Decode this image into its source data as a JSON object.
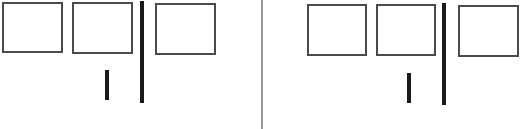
{
  "figure": {
    "width": 525,
    "height": 129,
    "background": "#ffffff",
    "colors": {
      "box_border": "#4a4a4a",
      "bar": "#1a1a1a",
      "divider": "#9a9a9a"
    }
  },
  "panels": [
    {
      "id": "left",
      "boxes": [
        {
          "x": 2,
          "y": 2,
          "w": 61,
          "h": 51
        },
        {
          "x": 72,
          "y": 2,
          "w": 61,
          "h": 52
        },
        {
          "x": 155,
          "y": 3,
          "w": 61,
          "h": 52
        }
      ],
      "bars": [
        {
          "kind": "short-bar",
          "x": 105,
          "y": 70,
          "w": 4,
          "h": 30
        },
        {
          "kind": "tall-bar",
          "x": 140,
          "y": 1,
          "w": 4,
          "h": 102
        }
      ]
    },
    {
      "id": "right",
      "boxes": [
        {
          "x": 307,
          "y": 4,
          "w": 60,
          "h": 52
        },
        {
          "x": 376,
          "y": 4,
          "w": 60,
          "h": 52
        },
        {
          "x": 458,
          "y": 5,
          "w": 61,
          "h": 52
        }
      ],
      "bars": [
        {
          "kind": "short-bar",
          "x": 407,
          "y": 73,
          "w": 4,
          "h": 30
        },
        {
          "kind": "tall-bar",
          "x": 442,
          "y": 3,
          "w": 4,
          "h": 102
        }
      ]
    }
  ],
  "divider": {
    "x": 261,
    "w": 2
  }
}
